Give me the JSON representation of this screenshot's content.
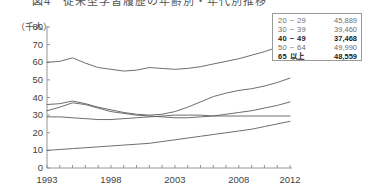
{
  "title": "図4　従来型学習履歴の年齢別・年代別推移",
  "unit_label": "（千人）",
  "legend": {
    "rows": [
      {
        "group": "20 ~ 29",
        "value": "45,889",
        "emphasis": false
      },
      {
        "group": "30 ~ 39",
        "value": "39,460",
        "emphasis": false
      },
      {
        "group": "40 ~ 49",
        "value": "37,468",
        "emphasis": true
      },
      {
        "group": "50 ~ 64",
        "value": "49,990",
        "emphasis": false
      },
      {
        "group": "65 以上",
        "value": "48,559",
        "emphasis": true
      }
    ]
  },
  "chart_data": {
    "type": "line",
    "title": "図4　従来型学習履歴の年齢別・年代別推移",
    "xlabel": "",
    "ylabel": "（千人）",
    "xlim": [
      1993,
      2012
    ],
    "ylim": [
      0,
      80
    ],
    "ytick_values": [
      0,
      10,
      20,
      30,
      40,
      50,
      60,
      70,
      80
    ],
    "xtick_values": [
      1993,
      1998,
      2003,
      2008,
      2012
    ],
    "xtick_labels": [
      "1993",
      "1998",
      "2003",
      "2008",
      "2012"
    ],
    "grid": false,
    "legend_position": "top-right",
    "x": [
      1993,
      1994,
      1995,
      1996,
      1997,
      1998,
      1999,
      2000,
      2001,
      2002,
      2003,
      2004,
      2005,
      2006,
      2007,
      2008,
      2009,
      2010,
      2011,
      2012
    ],
    "series": [
      {
        "name": "20~29",
        "legend_value": "45,889",
        "values": [
          60.0,
          60.5,
          62.5,
          59.5,
          57.0,
          56.0,
          55.0,
          55.5,
          57.0,
          56.5,
          56.0,
          56.5,
          57.5,
          59.0,
          60.5,
          62.0,
          64.0,
          66.0,
          68.5,
          71.5
        ]
      },
      {
        "name": "30~39",
        "legend_value": "39,460",
        "values": [
          36.0,
          36.5,
          38.0,
          36.5,
          34.5,
          33.0,
          31.5,
          30.5,
          30.0,
          30.5,
          32.0,
          34.5,
          37.5,
          40.5,
          42.5,
          44.0,
          45.0,
          46.5,
          48.5,
          51.0
        ]
      },
      {
        "name": "40~49",
        "legend_value": "37,468",
        "values": [
          32.5,
          34.5,
          37.0,
          36.0,
          34.0,
          32.0,
          31.0,
          30.0,
          29.5,
          29.0,
          28.5,
          28.5,
          29.0,
          29.5,
          30.5,
          31.5,
          32.5,
          34.0,
          35.5,
          37.5
        ]
      },
      {
        "name": "50~64",
        "legend_value": "49,990",
        "values": [
          29.0,
          29.0,
          28.5,
          28.0,
          27.5,
          27.5,
          28.0,
          28.5,
          29.0,
          29.5,
          30.0,
          30.0,
          30.0,
          29.5,
          29.5,
          29.5,
          29.5,
          29.5,
          29.5,
          29.5
        ]
      },
      {
        "name": "65以上",
        "legend_value": "48,559",
        "values": [
          10.0,
          10.5,
          11.0,
          11.5,
          12.0,
          12.5,
          13.0,
          13.5,
          14.0,
          15.0,
          16.0,
          17.0,
          18.0,
          19.0,
          20.0,
          21.0,
          22.0,
          23.5,
          25.0,
          26.5
        ]
      }
    ]
  }
}
